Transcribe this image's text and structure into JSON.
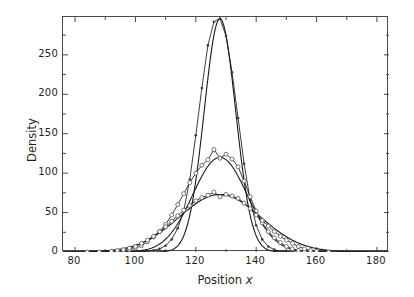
{
  "chart": {
    "title": "",
    "xlabel_main": "Position",
    "xlabel_var": "x",
    "ylabel": "Density"
  },
  "axes": {
    "x_ticks": [
      "80",
      "100",
      "120",
      "140",
      "160",
      "180"
    ],
    "y_ticks": [
      "0",
      "50",
      "100",
      "150",
      "200",
      "250"
    ]
  },
  "chart_data": {
    "type": "line",
    "title": "",
    "xlabel": "Position x",
    "ylabel": "Density",
    "xlim": [
      76,
      184
    ],
    "ylim": [
      0,
      298
    ],
    "xtick_values": [
      80,
      100,
      120,
      140,
      160,
      180
    ],
    "ytick_values": [
      0,
      50,
      100,
      150,
      200,
      250
    ],
    "x_minor_tick_step": 10,
    "y_minor_tick_step": 25,
    "grid": false,
    "legend": false,
    "marker_style": "open-circle",
    "line_color": "#1a1a1a",
    "marker_color": "#555555",
    "series": [
      {
        "name": "narrow-peak",
        "marker": "small-dot",
        "peak_x": 128,
        "peak_y": 296,
        "sigma": 5.2,
        "x": [
          96,
          98,
          100,
          102,
          104,
          106,
          108,
          110,
          112,
          114,
          116,
          118,
          120,
          122,
          124,
          126,
          128,
          130,
          132,
          134,
          136,
          138,
          140,
          142,
          144,
          146,
          148,
          150,
          152
        ],
        "values": [
          0,
          0,
          0,
          0.5,
          1,
          2,
          4,
          8,
          16,
          30,
          52,
          92,
          148,
          208,
          262,
          292,
          296,
          274,
          228,
          170,
          112,
          66,
          34,
          16,
          7,
          3,
          1,
          0.5,
          0
        ]
      },
      {
        "name": "medium-peak",
        "marker": "open-circle",
        "peak_x": 128,
        "peak_y": 120,
        "sigma": 9.0,
        "x": [
          92,
          94,
          96,
          98,
          100,
          102,
          104,
          106,
          108,
          110,
          112,
          114,
          116,
          118,
          120,
          122,
          124,
          126,
          128,
          130,
          132,
          134,
          136,
          138,
          140,
          142,
          144,
          146,
          148,
          150,
          152,
          154,
          156,
          158,
          160
        ],
        "values": [
          0,
          1,
          2,
          3,
          5,
          8,
          13,
          19,
          26,
          35,
          47,
          60,
          74,
          88,
          100,
          110,
          117,
          130,
          119,
          124,
          118,
          108,
          90,
          70,
          52,
          37,
          26,
          18,
          12,
          7,
          4,
          2,
          1,
          0.5,
          0
        ]
      },
      {
        "name": "broad-peak",
        "marker": "open-circle",
        "peak_x": 128,
        "peak_y": 73,
        "sigma": 13.5,
        "x": [
          84,
          88,
          92,
          94,
          96,
          98,
          100,
          102,
          104,
          106,
          108,
          110,
          112,
          114,
          116,
          118,
          120,
          122,
          124,
          126,
          128,
          130,
          132,
          134,
          136,
          138,
          140,
          142,
          144,
          146,
          148,
          150,
          152,
          154,
          156,
          158,
          160,
          164
        ],
        "values": [
          0,
          0,
          1,
          2,
          3,
          5,
          7,
          11,
          15,
          20,
          26,
          32,
          39,
          46,
          53,
          59,
          65,
          69,
          72,
          76,
          70,
          73,
          71,
          68,
          62,
          55,
          47,
          40,
          33,
          26,
          20,
          15,
          11,
          7,
          4,
          2,
          1,
          0
        ]
      }
    ]
  }
}
